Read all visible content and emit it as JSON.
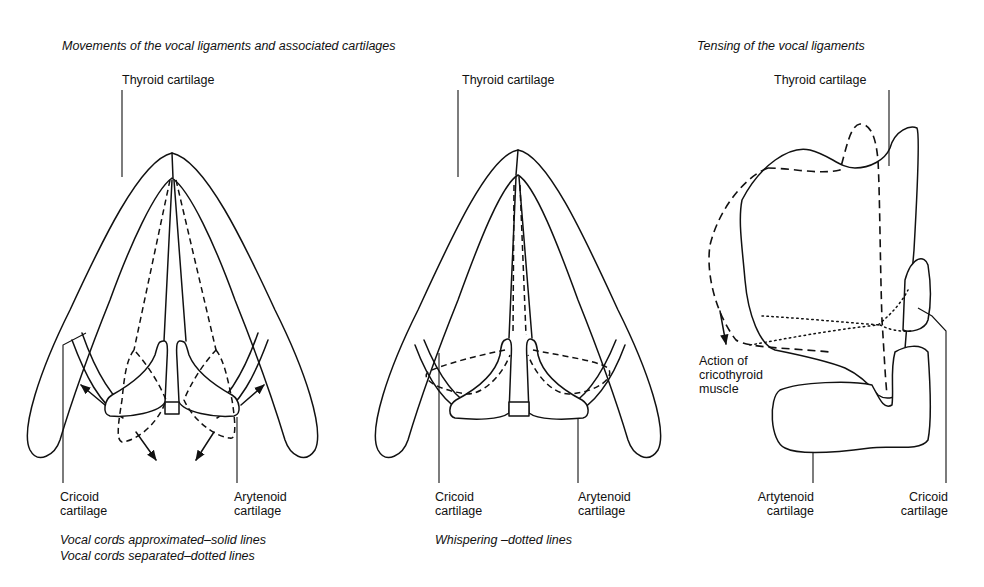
{
  "titles": {
    "left": "Movements of the vocal ligaments and associated cartilages",
    "right": "Tensing of the vocal ligaments"
  },
  "panels": [
    {
      "id": "approximated-separated",
      "labels": {
        "thyroid": "Thyroid cartilage",
        "cricoid_line1": "Cricoid",
        "cricoid_line2": "cartilage",
        "arytenoid_line1": "Arytenoid",
        "arytenoid_line2": "cartilage"
      },
      "caption_lines": [
        "Vocal cords approximated–solid lines",
        "Vocal cords separated–dotted lines"
      ]
    },
    {
      "id": "whispering",
      "labels": {
        "thyroid": "Thyroid cartilage",
        "cricoid_line1": "Cricoid",
        "cricoid_line2": "cartilage",
        "arytenoid_line1": "Arytenoid",
        "arytenoid_line2": "cartilage"
      },
      "caption_lines": [
        "Whispering –dotted lines"
      ]
    },
    {
      "id": "tensing",
      "labels": {
        "thyroid": "Thyroid cartilage",
        "action_line1": "Action of",
        "action_line2": "cricothyroid",
        "action_line3": "muscle",
        "arytenoid_line1": "Artytenoid",
        "arytenoid_line2": "cartilage",
        "cricoid_line1": "Cricoid",
        "cricoid_line2": "cartilage"
      }
    }
  ],
  "legend": {
    "solid": "solid lines",
    "dashed": "dotted lines"
  }
}
